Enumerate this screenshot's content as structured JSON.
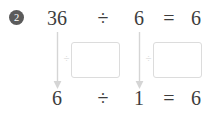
{
  "problem": {
    "number": "2",
    "top_equation": {
      "dividend": "36",
      "divide_symbol": "÷",
      "divisor": "6",
      "equals_symbol": "=",
      "quotient": "6"
    },
    "bottom_equation": {
      "dividend": "6",
      "divide_symbol": "÷",
      "divisor": "1",
      "equals_symbol": "=",
      "quotient": "6"
    },
    "steps": [
      {
        "operator": "÷",
        "answer": ""
      },
      {
        "operator": "÷",
        "answer": ""
      }
    ]
  },
  "colors": {
    "badge_background": "#5b5b5b",
    "badge_text": "#ffffff",
    "text": "#3d3d3d",
    "arrow": "#d5d5d5",
    "box_border": "#dcdcdc",
    "mini_operator": "#d2d2d2",
    "page_background": "#ffffff"
  }
}
